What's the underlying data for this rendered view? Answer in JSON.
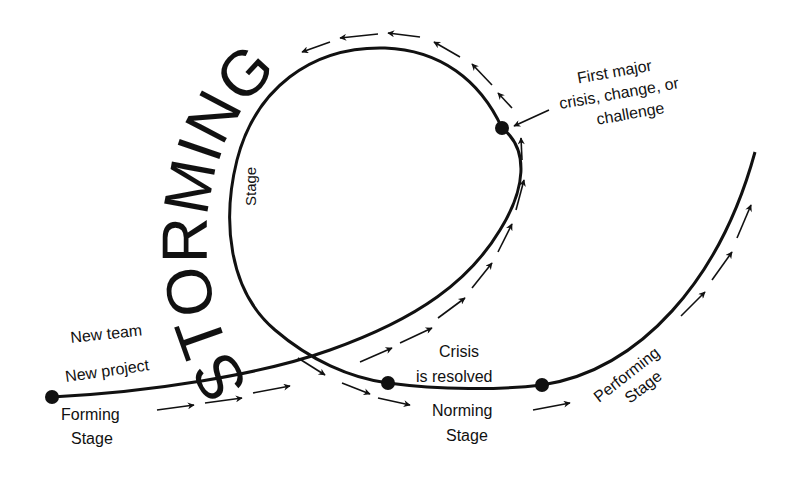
{
  "diagram": {
    "type": "team-development-stages",
    "title_arc": "STORMING",
    "storming_sublabel": "Stage",
    "start_labels": [
      "New team",
      "New project"
    ],
    "forming": [
      "Forming",
      "Stage"
    ],
    "crisis_callout": [
      "First major",
      "crisis, change, or",
      "challenge"
    ],
    "crisis_resolved": [
      "Crisis",
      "is resolved"
    ],
    "norming": [
      "Norming",
      "Stage"
    ],
    "performing": [
      "Performing",
      "Stage"
    ],
    "colors": {
      "line": "#111111",
      "background": "#ffffff"
    }
  }
}
